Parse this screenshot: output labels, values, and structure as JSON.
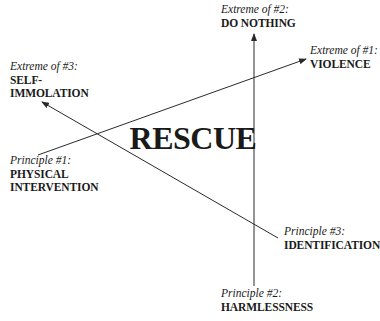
{
  "diagram": {
    "center_label": "RESCUE",
    "axes": [
      {
        "id": 1,
        "principle": {
          "caption": "Principle #1:",
          "lines": [
            "PHYSICAL",
            "INTERVENTION"
          ]
        },
        "extreme": {
          "caption": "Extreme of #1:",
          "lines": [
            "VIOLENCE"
          ]
        }
      },
      {
        "id": 2,
        "principle": {
          "caption": "Principle #2:",
          "lines": [
            "HARMLESSNESS"
          ]
        },
        "extreme": {
          "caption": "Extreme of #2:",
          "lines": [
            "DO NOTHING"
          ]
        }
      },
      {
        "id": 3,
        "principle": {
          "caption": "Principle #3:",
          "lines": [
            "IDENTIFICATION"
          ]
        },
        "extreme": {
          "caption": "Extreme of #3:",
          "lines": [
            "SELF-",
            "IMMOLATION"
          ]
        }
      }
    ],
    "colors": {
      "line": "#2a2a2a",
      "text": "#1a1a1a",
      "background": "#ffffff"
    }
  }
}
